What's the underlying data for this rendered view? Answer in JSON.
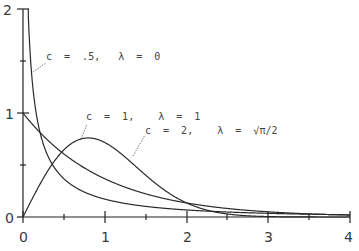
{
  "chart_data": {
    "type": "line",
    "title": "",
    "xlabel": "",
    "ylabel": "",
    "xlim": [
      0,
      4
    ],
    "ylim": [
      0,
      2
    ],
    "grid": false,
    "x_ticks": [
      0,
      0.5,
      1,
      1.5,
      2,
      2.5,
      3,
      3.5,
      4
    ],
    "x_tick_labels": [
      "0",
      "1",
      "2",
      "3",
      "4"
    ],
    "y_ticks": [
      0,
      0.5,
      1,
      1.5,
      2
    ],
    "y_tick_labels": [
      "0",
      "1",
      "2"
    ],
    "series": [
      {
        "name": "c = .5,  λ = 0",
        "shape_c": 0.5,
        "x": [
          0.02,
          0.05,
          0.1,
          0.2,
          0.3,
          0.5,
          0.75,
          1,
          1.5,
          2,
          2.5,
          3,
          3.5,
          4
        ],
        "values": [
          2.0,
          1.44,
          1.1,
          0.73,
          0.56,
          0.37,
          0.24,
          0.17,
          0.09,
          0.05,
          0.03,
          0.02,
          0.01,
          0.01
        ]
      },
      {
        "name": "c = 1,  λ = 1",
        "shape_c": 1,
        "x": [
          0,
          0.25,
          0.5,
          0.75,
          1,
          1.5,
          2,
          2.5,
          3,
          3.5,
          4
        ],
        "values": [
          1.0,
          0.78,
          0.61,
          0.47,
          0.37,
          0.22,
          0.14,
          0.08,
          0.05,
          0.03,
          0.02
        ]
      },
      {
        "name": "c = 2,  λ = √π/2",
        "shape_c": 2,
        "x": [
          0,
          0.25,
          0.5,
          0.8,
          1,
          1.25,
          1.5,
          2,
          2.5,
          3,
          3.5,
          4
        ],
        "values": [
          0.0,
          0.37,
          0.65,
          0.76,
          0.72,
          0.6,
          0.45,
          0.17,
          0.04,
          0.01,
          0.0,
          0.0
        ]
      }
    ],
    "annotations": [
      {
        "text": "c = .5,  λ = 0",
        "points_to": "series 1"
      },
      {
        "text": "c = 1,  λ = 1",
        "points_to": "series 2"
      },
      {
        "text": "c = 2,  λ = √π/2",
        "points_to": "series 3"
      }
    ]
  },
  "labels": {
    "y0": "0",
    "y1": "1",
    "y2": "2",
    "x0": "0",
    "x1": "1",
    "x2": "2",
    "x3": "3",
    "x4": "4",
    "ann1": "c  =  .5,   λ  =  0",
    "ann2": "c  =  1,    λ  =  1",
    "ann3": "c  =  2,    λ  =  √π/2"
  }
}
